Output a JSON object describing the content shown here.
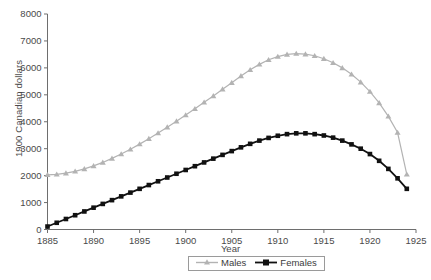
{
  "chart_data": {
    "type": "line",
    "title": "",
    "xlabel": "Year",
    "ylabel": "1900 Canadian dollars",
    "xlim": [
      1885,
      1925
    ],
    "ylim": [
      0,
      8000
    ],
    "xticks": [
      1885,
      1890,
      1895,
      1900,
      1905,
      1910,
      1915,
      1920,
      1925
    ],
    "yticks": [
      0,
      1000,
      2000,
      3000,
      4000,
      5000,
      6000,
      7000,
      8000
    ],
    "grid": false,
    "legend_position": "bottom-center",
    "x": [
      1885,
      1886,
      1887,
      1888,
      1889,
      1890,
      1891,
      1892,
      1893,
      1894,
      1895,
      1896,
      1897,
      1898,
      1899,
      1900,
      1901,
      1902,
      1903,
      1904,
      1905,
      1906,
      1907,
      1908,
      1909,
      1910,
      1911,
      1912,
      1913,
      1914,
      1915,
      1916,
      1917,
      1918,
      1919,
      1920,
      1921,
      1922,
      1923,
      1924
    ],
    "series": [
      {
        "name": "Males",
        "color": "#b3b3b3",
        "marker": "triangle",
        "values": [
          2030,
          2050,
          2090,
          2160,
          2250,
          2360,
          2490,
          2640,
          2800,
          2980,
          3170,
          3370,
          3580,
          3800,
          4020,
          4250,
          4480,
          4720,
          4960,
          5210,
          5450,
          5700,
          5930,
          6130,
          6300,
          6420,
          6500,
          6530,
          6510,
          6450,
          6340,
          6190,
          6000,
          5760,
          5470,
          5120,
          4700,
          4200,
          3600,
          2050
        ]
      },
      {
        "name": "Females",
        "color": "#111111",
        "marker": "square",
        "values": [
          110,
          250,
          390,
          530,
          670,
          810,
          950,
          1090,
          1230,
          1370,
          1510,
          1650,
          1790,
          1930,
          2070,
          2210,
          2350,
          2490,
          2630,
          2770,
          2910,
          3050,
          3180,
          3300,
          3400,
          3480,
          3540,
          3570,
          3570,
          3540,
          3490,
          3410,
          3300,
          3160,
          3000,
          2800,
          2550,
          2250,
          1900,
          1510
        ]
      }
    ]
  },
  "legend": {
    "entries": [
      {
        "label": "Males"
      },
      {
        "label": "Females"
      }
    ]
  }
}
